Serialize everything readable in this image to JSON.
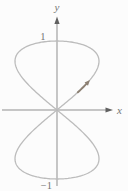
{
  "figure": {
    "labels": {
      "x_axis": "x",
      "y_axis": "y",
      "y_tick_top": "1",
      "y_tick_bottom": "−1"
    },
    "colors": {
      "background": "#fcfcfc",
      "axis": "#8f8f8f",
      "axis_arrowhead": "#606060",
      "curve": "#bcbcbc",
      "direction_arrow": "#8d8174",
      "label_text": "#757575"
    }
  },
  "chart_data": {
    "type": "line",
    "title": "",
    "curve_name": "vertical figure-eight (Lissajous-type) curve",
    "parametric": {
      "x": "sin(2t)",
      "y": "sin(t)",
      "t_range": [
        0,
        6.2832
      ]
    },
    "points": [
      [
        0,
        0
      ],
      [
        0.87,
        0.5
      ],
      [
        1,
        0.71
      ],
      [
        0.87,
        0.87
      ],
      [
        0,
        1
      ],
      [
        -0.87,
        0.87
      ],
      [
        -1,
        0.71
      ],
      [
        -0.87,
        0.5
      ],
      [
        0,
        0
      ],
      [
        0.87,
        -0.5
      ],
      [
        1,
        -0.71
      ],
      [
        0.87,
        -0.87
      ],
      [
        0,
        -1
      ],
      [
        -0.87,
        -0.87
      ],
      [
        -1,
        -0.71
      ],
      [
        -0.87,
        -0.5
      ],
      [
        0,
        0
      ]
    ],
    "xlabel": "x",
    "ylabel": "y",
    "xlim_shown": [
      -0.8,
      0.9
    ],
    "ylim": [
      -1,
      1
    ],
    "x_tick_labels": [],
    "y_tick_labels": [
      "1",
      "−1"
    ],
    "grid": false,
    "legend": null,
    "annotations": [
      {
        "type": "direction-arrow",
        "t": 0.42,
        "meaning": "traversal direction: upward along right side of upper lobe (increasing t)"
      }
    ]
  }
}
